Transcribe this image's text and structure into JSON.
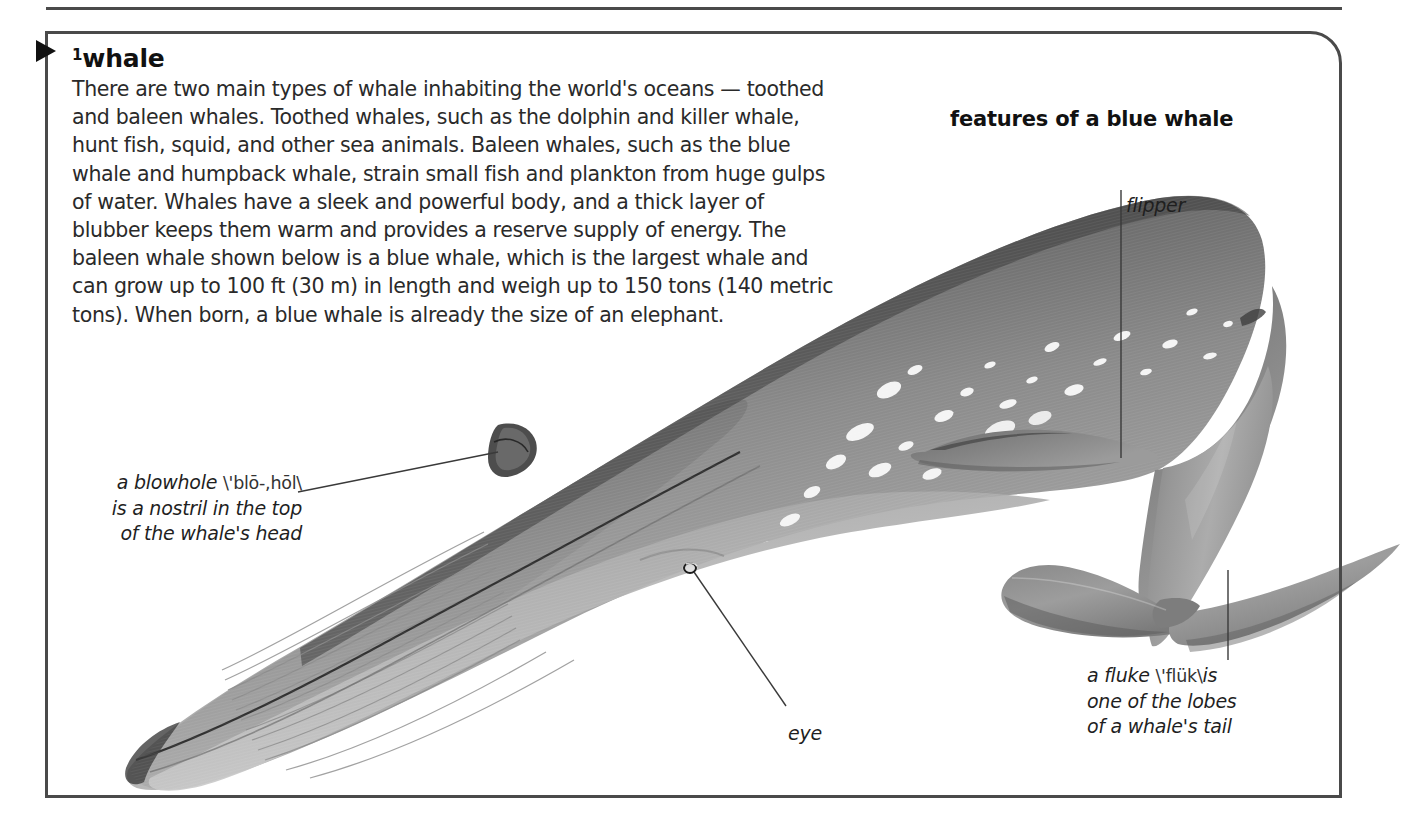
{
  "entry": {
    "headword_superscript": "1",
    "headword": "whale",
    "definition": "There are two main types of whale inhabiting the world's oceans — toothed and baleen whales. Toothed whales, such as the dolphin and killer whale, hunt fish, squid, and other sea animals. Baleen whales, such as the blue whale and humpback whale, strain small fish and plankton from huge gulps of water. Whales have a sleek and powerful body, and a thick layer of blubber keeps them warm and provides a reserve supply of energy. The baleen whale shown below is a blue whale, which is the largest whale and can grow up to 100 ft (30 m) in length and weigh up to 150 tons (140 metric tons). When born, a blue whale is already the size of an elephant."
  },
  "figure": {
    "title": "features of a blue whale",
    "callouts": {
      "flipper": {
        "label": "flipper"
      },
      "blowhole": {
        "term": "a blowhole",
        "pronunciation": "\\'blō-,hōl\\",
        "rest": "is a nostril in the top\nof the whale's head"
      },
      "eye": {
        "label": "eye"
      },
      "fluke": {
        "term": "a fluke",
        "pronunciation": "\\'flük\\",
        "rest": "is\none of the lobes\nof a whale's tail"
      }
    }
  },
  "colors": {
    "border": "#4a4a4a",
    "text": "#2a2a2a",
    "heading": "#111111",
    "leader_line": "#3a3a3a",
    "whale_dark": "#5a5a5a",
    "whale_mid": "#8d8d8d",
    "whale_light": "#b8b8b8",
    "whale_belly": "#c9c9c9",
    "background": "#ffffff"
  }
}
